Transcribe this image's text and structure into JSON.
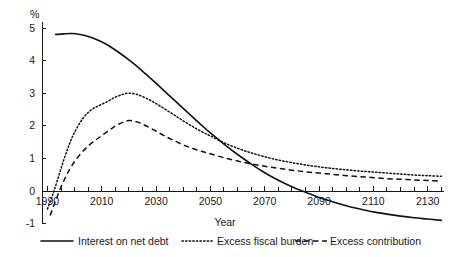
{
  "chart_data": {
    "type": "line",
    "title": "",
    "xlabel": "Year",
    "ylabel": "",
    "unit_label": "%",
    "xlim": [
      1988,
      2136
    ],
    "ylim": [
      -1,
      5
    ],
    "grid": false,
    "legend_position": "bottom",
    "xticks_major": [
      1990,
      2010,
      2030,
      2050,
      2070,
      2090,
      2110,
      2130
    ],
    "xtick_labels": [
      "1990",
      "2010",
      "2030",
      "2050",
      "2070",
      "2090",
      "2110",
      "2130"
    ],
    "xtick_minor_step": 5,
    "yticks": [
      -1,
      0,
      1,
      2,
      3,
      4,
      5
    ],
    "ytick_labels": [
      "-1",
      "0",
      "1",
      "2",
      "3",
      "4",
      "5"
    ],
    "series": [
      {
        "name": "Interest on net debt",
        "style": "solid",
        "x": [
          1993,
          1996,
          1999,
          2002,
          2005,
          2008,
          2011,
          2014,
          2017,
          2020,
          2023,
          2026,
          2029,
          2032,
          2035,
          2038,
          2041,
          2044,
          2047,
          2050,
          2055,
          2060,
          2065,
          2070,
          2075,
          2080,
          2085,
          2087,
          2090,
          2095,
          2100,
          2105,
          2110,
          2115,
          2120,
          2125,
          2130,
          2135
        ],
        "values": [
          4.8,
          4.82,
          4.83,
          4.8,
          4.74,
          4.65,
          4.53,
          4.38,
          4.21,
          4.02,
          3.82,
          3.6,
          3.38,
          3.15,
          2.92,
          2.69,
          2.46,
          2.23,
          2.0,
          1.78,
          1.44,
          1.12,
          0.83,
          0.56,
          0.33,
          0.13,
          -0.04,
          -0.1,
          -0.2,
          -0.33,
          -0.45,
          -0.55,
          -0.64,
          -0.71,
          -0.77,
          -0.82,
          -0.86,
          -0.9
        ]
      },
      {
        "name": "Excess fiscal burden",
        "style": "dotted",
        "x": [
          1990,
          1992,
          1994,
          1996,
          1998,
          2000,
          2003,
          2006,
          2009,
          2012,
          2015,
          2018,
          2020,
          2023,
          2026,
          2029,
          2032,
          2035,
          2038,
          2041,
          2044,
          2047,
          2050,
          2055,
          2060,
          2065,
          2070,
          2075,
          2080,
          2085,
          2090,
          2095,
          2100,
          2105,
          2110,
          2115,
          2120,
          2125,
          2130,
          2135
        ],
        "values": [
          -0.55,
          -0.1,
          0.42,
          0.95,
          1.42,
          1.8,
          2.22,
          2.48,
          2.62,
          2.74,
          2.88,
          2.97,
          3.0,
          2.96,
          2.86,
          2.73,
          2.58,
          2.42,
          2.26,
          2.1,
          1.95,
          1.81,
          1.69,
          1.48,
          1.31,
          1.17,
          1.05,
          0.95,
          0.87,
          0.8,
          0.74,
          0.69,
          0.65,
          0.61,
          0.58,
          0.55,
          0.52,
          0.49,
          0.47,
          0.45
        ]
      },
      {
        "name": "Excess contribution",
        "style": "dashed",
        "x": [
          1991,
          1993,
          1995,
          1997,
          1999,
          2002,
          2005,
          2008,
          2011,
          2014,
          2017,
          2020,
          2023,
          2026,
          2029,
          2032,
          2035,
          2038,
          2041,
          2044,
          2047,
          2050,
          2055,
          2060,
          2065,
          2070,
          2075,
          2080,
          2085,
          2090,
          2095,
          2100,
          2105,
          2110,
          2115,
          2120,
          2125,
          2130,
          2135
        ],
        "values": [
          -0.75,
          -0.3,
          0.12,
          0.48,
          0.78,
          1.12,
          1.38,
          1.58,
          1.76,
          1.94,
          2.08,
          2.16,
          2.12,
          2.01,
          1.88,
          1.74,
          1.61,
          1.49,
          1.38,
          1.29,
          1.21,
          1.14,
          1.02,
          0.92,
          0.83,
          0.76,
          0.7,
          0.64,
          0.59,
          0.55,
          0.51,
          0.47,
          0.44,
          0.41,
          0.38,
          0.36,
          0.34,
          0.32,
          0.3
        ]
      }
    ]
  },
  "legend": {
    "items": [
      {
        "label": "Interest on net debt",
        "style": "solid"
      },
      {
        "label": "Excess fiscal burden",
        "style": "dotted"
      },
      {
        "label": "Excess contribution",
        "style": "dashed"
      }
    ]
  }
}
